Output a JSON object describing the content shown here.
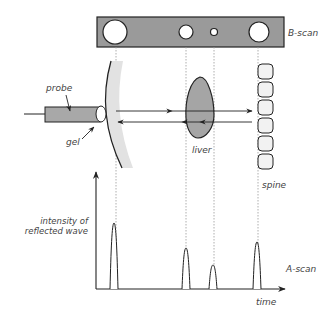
{
  "labels": {
    "b_scan": "B-scan",
    "a_scan": "A-scan",
    "probe": "probe",
    "gel": "gel",
    "liver": "liver",
    "spine": "spine",
    "y_axis_line1": "intensity of",
    "y_axis_line2": "reflected wave",
    "x_axis": "time"
  },
  "colors": {
    "bscan_fill": "#9a9a9a",
    "probe_fill": "#a8a8a8",
    "liver_fill": "#a5a5a5",
    "skin_band": "#e2e2e2",
    "vertebra_fill": "#f2f2f2",
    "stroke": "#222222",
    "dotted": "#999999",
    "text": "#444444"
  },
  "bscan_echoes": [
    {
      "name": "skin",
      "cx": 115,
      "r": 12
    },
    {
      "name": "liver-front",
      "cx": 186,
      "r": 7
    },
    {
      "name": "liver-back",
      "cx": 214,
      "r": 3.5
    },
    {
      "name": "spine",
      "cx": 259,
      "r": 10
    }
  ],
  "ascan_pulses": [
    {
      "name": "skin",
      "x": 114,
      "peak_y": 223
    },
    {
      "name": "liver-front",
      "x": 186,
      "peak_y": 248
    },
    {
      "name": "liver-back",
      "x": 213,
      "peak_y": 265
    },
    {
      "name": "spine",
      "x": 257,
      "peak_y": 242
    }
  ],
  "vertebrae_count": 6
}
